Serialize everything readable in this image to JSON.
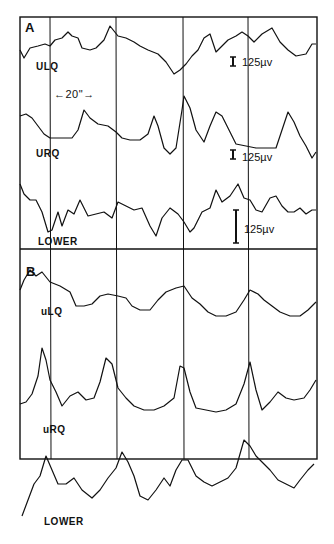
{
  "chart_data": {
    "type": "line",
    "title": "",
    "xlabel": "",
    "ylabel": "",
    "grid": "vertical time markers",
    "time_marker": "20\"",
    "panels": [
      {
        "label": "A",
        "series": [
          {
            "name": "ULQ",
            "scale": "125 µv",
            "points": "20,50 24,58 30,48 38,46 45,44 50,46 55,40 62,38 68,32 72,36 78,38 82,48 90,50 96,48 104,40 110,26 118,36 126,38 134,42 140,46 148,50 158,54 166,62 174,74 180,70 186,64 192,56 198,50 204,38 210,34 216,52 222,46 228,40 236,36 242,32 248,36 254,42 262,34 272,28 280,42 288,50 296,56 306,54 312,44 316,44"
          },
          {
            "name": "URQ",
            "scale": "125 µv",
            "points": "20,116 26,114 32,118 38,126 44,134 50,138 56,138 64,138 72,138 78,130 84,110 90,118 98,124 108,126 116,132 122,138 130,140 140,140 148,134 154,116 158,126 164,148 170,154 176,148 182,110 184,96 190,108 196,130 204,142 210,126 216,112 222,116 228,128 236,144 246,146 256,148 266,148 276,148 284,124 288,112 294,122 300,136 306,146 312,158 316,152"
          },
          {
            "name": "LOWER",
            "scale": "125 µv",
            "points": "20,184 24,194 30,200 36,200 42,212 48,232 52,230 58,212 62,226 68,210 74,214 80,200 88,216 96,214 104,212 112,218 118,202 126,206 134,210 142,208 150,226 156,236 162,218 170,208 178,214 184,222 190,232 194,228 202,212 210,208 216,190 222,202 230,196 238,184 244,198 250,200 256,210 262,212 270,198 276,196 282,206 288,212 294,212 300,208 306,214 312,210 316,210"
          }
        ]
      },
      {
        "label": "B",
        "series": [
          {
            "name": "uLQ",
            "scale": "",
            "points": "20,290 24,280 30,270 36,276 42,272 50,282 60,286 70,292 76,306 84,306 92,304 100,296 108,294 118,296 126,298 132,306 140,310 150,310 158,300 166,292 176,288 184,286 192,298 200,304 208,312 216,316 226,316 236,312 244,300 250,290 258,294 264,300 272,306 280,312 290,316 300,316 308,310 316,302"
          },
          {
            "name": "uRQ",
            "scale": "",
            "points": "20,404 26,402 32,394 38,376 42,348 46,360 50,380 56,392 62,406 70,396 78,392 86,400 94,398 100,382 106,358 112,364 118,388 126,398 134,406 144,410 154,410 164,406 174,398 180,366 184,368 190,392 196,408 206,410 216,412 226,410 236,404 244,384 250,362 256,390 262,410 270,402 278,392 286,398 294,400 304,398 310,390 316,380"
          },
          {
            "name": "LOWER",
            "scale": "",
            "points": "22,516 28,500 34,484 40,476 46,456 52,470 58,484 66,484 74,478 82,490 92,498 100,490 108,478 116,468 122,452 128,462 134,476 140,496 148,500 156,490 164,478 170,486 176,470 182,460 188,460 196,476 204,482 212,486 220,482 228,478 236,468 244,440 250,446 256,456 262,462 270,470 278,480 286,484 294,488 300,480 308,470 314,464"
          }
        ]
      }
    ],
    "frame": {
      "x": 20,
      "y": 17,
      "width": 297,
      "height": 442
    },
    "panel_divider_y": 249,
    "vertical_markers_x": [
      50,
      116,
      183,
      248
    ],
    "scale_bars": [
      {
        "x": 233,
        "y1": 57,
        "y2": 66,
        "label": "125 µv"
      },
      {
        "x": 233,
        "y1": 150,
        "y2": 159,
        "label": "125 µv"
      },
      {
        "x": 236,
        "y1": 210,
        "y2": 243,
        "label": "125 µv"
      }
    ]
  },
  "labels": {
    "panel_a": "A",
    "panel_b": "B",
    "a_ulq": "ULQ",
    "a_urq": "URQ",
    "a_lower": "LOWER",
    "b_ulq": "uLQ",
    "b_urq": "uRQ",
    "b_lower": "LOWER",
    "time_marker": "←20\"→",
    "scale_1": "125µv",
    "scale_2": "125µv",
    "scale_3": "125µv"
  }
}
